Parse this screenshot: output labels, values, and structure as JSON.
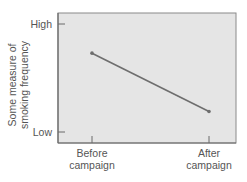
{
  "chart_data": {
    "type": "line",
    "title": "",
    "xlabel": "",
    "ylabel": "Some measure of smoking frequency",
    "ylabel_lines": [
      "Some measure of",
      "smoking frequency"
    ],
    "categories": [
      "Before campaign",
      "After campaign"
    ],
    "category_lines": [
      [
        "Before",
        "campaign"
      ],
      [
        "After",
        "campaign"
      ]
    ],
    "y_tick_labels": [
      "High",
      "Low"
    ],
    "y_scale_note": "0 = Low, 1 = High (qualitative axis)",
    "ylim": [
      0,
      1
    ],
    "series": [
      {
        "name": "Smoking frequency",
        "values": [
          0.73,
          0.19
        ],
        "color": "#6e6e6e"
      }
    ],
    "grid": false,
    "legend": null
  },
  "colors": {
    "plot_background": "#e5e5e5",
    "axis": "#7a7a7a",
    "line": "#6e6e6e",
    "text": "#555555"
  },
  "labels": {
    "y_high": "High",
    "y_low": "Low",
    "ylabel_line1": "Some measure of",
    "ylabel_line2": "smoking frequency",
    "x_before_line1": "Before",
    "x_before_line2": "campaign",
    "x_after_line1": "After",
    "x_after_line2": "campaign"
  }
}
